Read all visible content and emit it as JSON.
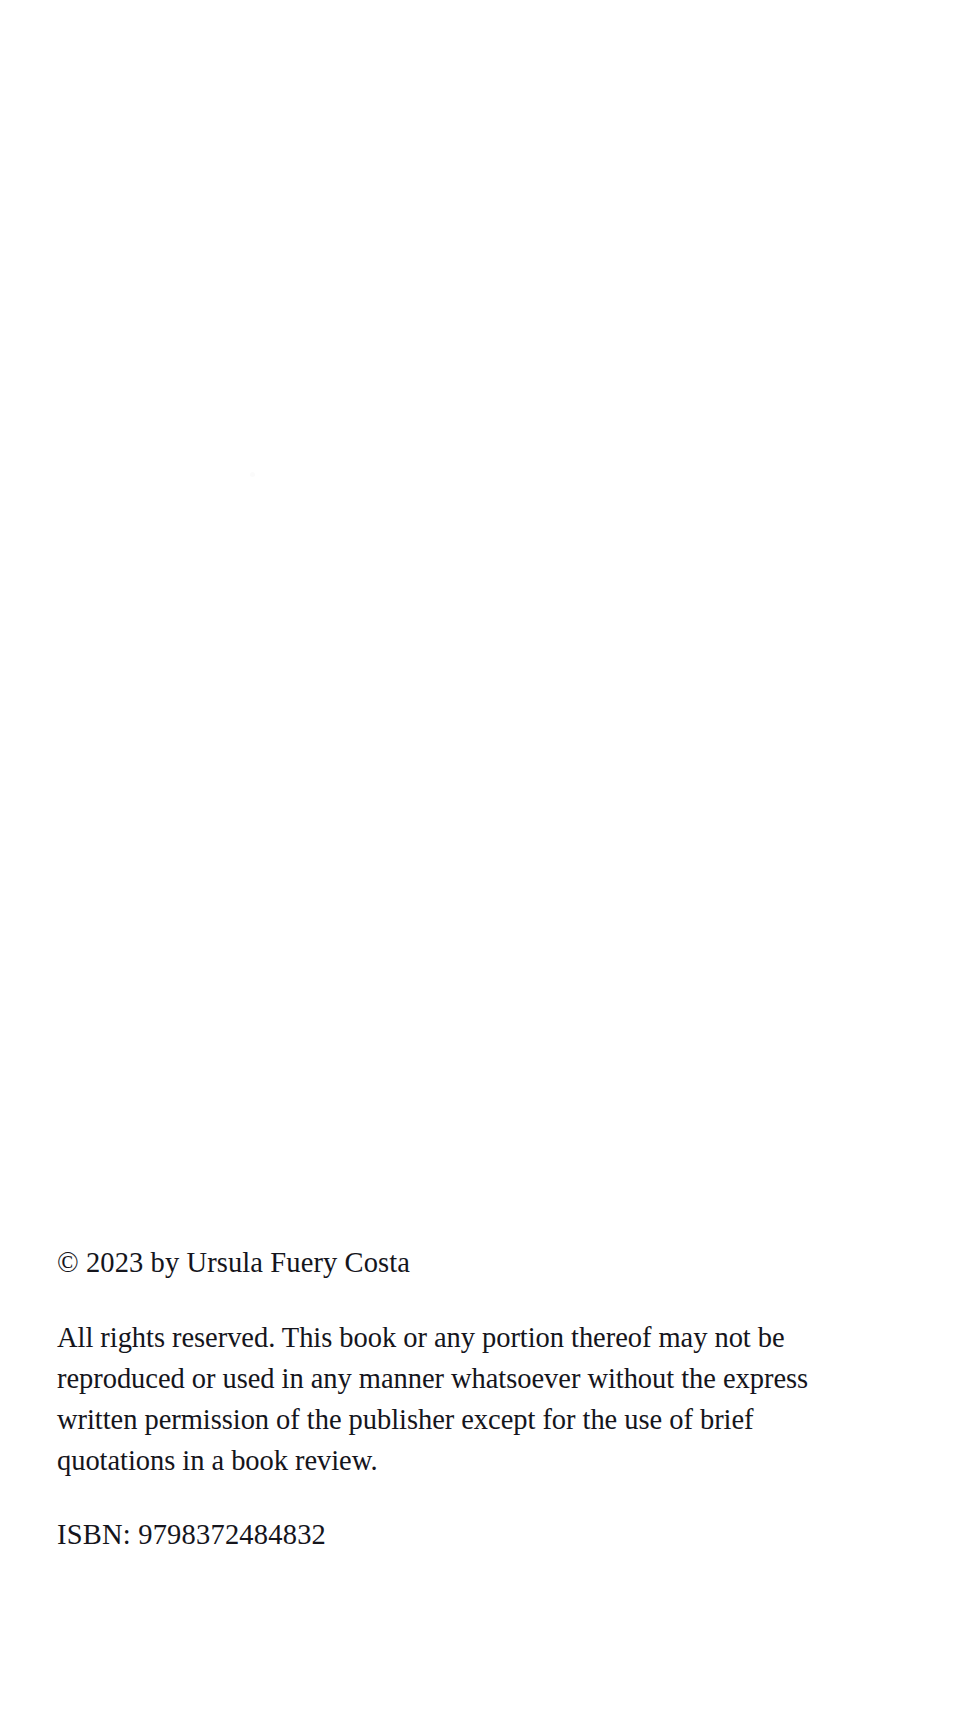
{
  "page": {
    "type": "book-copyright-page",
    "background_color": "#ffffff",
    "text_color": "#15151c"
  },
  "colophon": {
    "copyright_notice": "© 2023 by Ursula Fuery Costa",
    "copyright_symbol": "©",
    "year": "2023",
    "rights_holder": "Ursula Fuery Costa",
    "rights_statement": "All rights reserved. This book or any portion thereof may not be reproduced or used in any manner whatsoever without the express written permission of the publisher except for the use of brief quotations in a book review.",
    "rights_statement_lines": [
      "All rights reserved. This book or any portion thereof may not be reproduced",
      "or used in any manner whatsoever without the express written permission",
      "of the publisher except for the use of brief quotations in a book review."
    ],
    "isbn_line": "ISBN: 9798372484832",
    "isbn_label": "ISBN:",
    "isbn_value": "9798372484832"
  }
}
